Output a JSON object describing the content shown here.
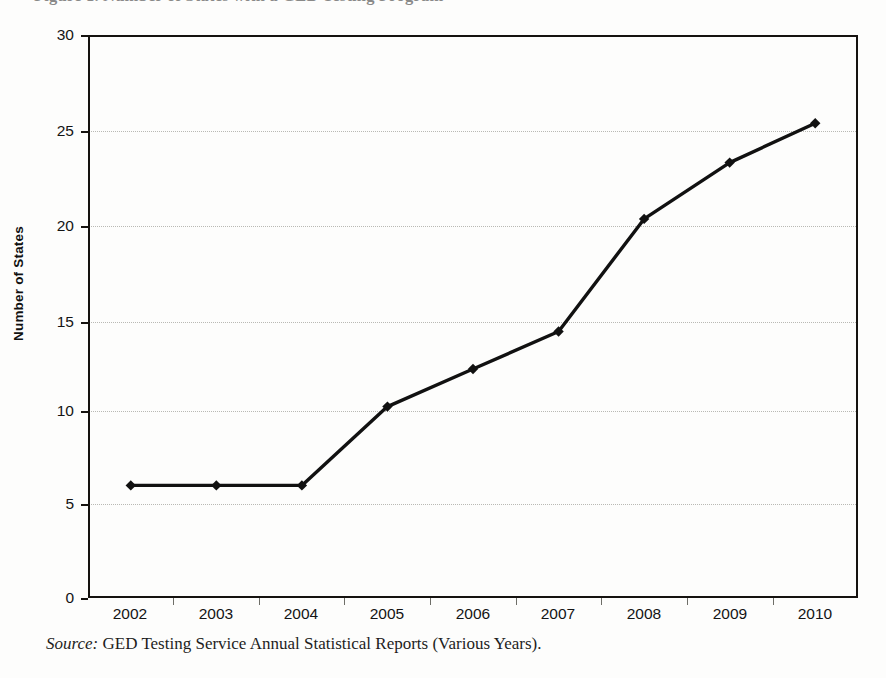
{
  "figure": {
    "clipped_title": "Figure 1. Number of States with a GED Testing Program",
    "source_lead": "Source:",
    "source_text": " GED Testing Service Annual Statistical Reports (Various Years)."
  },
  "chart_data": {
    "type": "line",
    "title": "",
    "xlabel": "",
    "ylabel": "Number of States",
    "categories": [
      "2002",
      "2003",
      "2004",
      "2005",
      "2006",
      "2007",
      "2008",
      "2009",
      "2010"
    ],
    "values": [
      6.0,
      6.0,
      6.0,
      10.2,
      12.2,
      14.2,
      20.2,
      23.2,
      25.3
    ],
    "ylim": [
      0,
      30
    ],
    "yticks": [
      0,
      5,
      10,
      15,
      20,
      25,
      30
    ],
    "ytick_labels": [
      "0",
      "5",
      "10",
      "15",
      "20",
      "25",
      "30"
    ],
    "grid": true,
    "grid_axis": "y",
    "grid_style": "dotted",
    "legend": false,
    "legend_position": "none",
    "marker": "diamond",
    "line_color": "#111111",
    "marker_color": "#111111",
    "grid_color": "#b9b9b4",
    "axis_color": "#15120f",
    "background_color": "#fdfdfc"
  }
}
